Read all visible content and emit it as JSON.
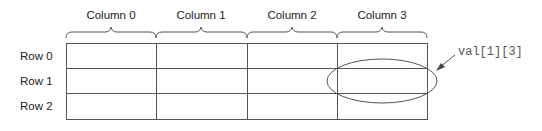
{
  "diagram": {
    "columns": [
      "Column 0",
      "Column 1",
      "Column 2",
      "Column 3"
    ],
    "rows": [
      "Row 0",
      "Row 1",
      "Row 2"
    ],
    "highlight": {
      "row": 1,
      "column": 3,
      "label": "val[1][3]"
    },
    "colors": {
      "line": "#555555",
      "text": "#222222",
      "label": "#555555"
    }
  }
}
